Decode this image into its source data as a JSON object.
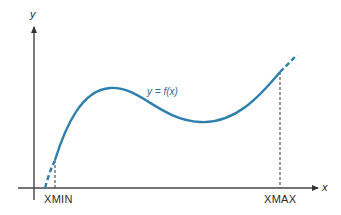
{
  "diagram": {
    "y_axis_label": "y",
    "x_axis_label": "x",
    "function_label": "y = f(x)",
    "xmin_label": "XMIN",
    "xmax_label": "XMAX",
    "colors": {
      "curve": "#2f7fae",
      "axes": "#333333",
      "text": "#2a2a2a",
      "background": "#ffffff"
    }
  }
}
